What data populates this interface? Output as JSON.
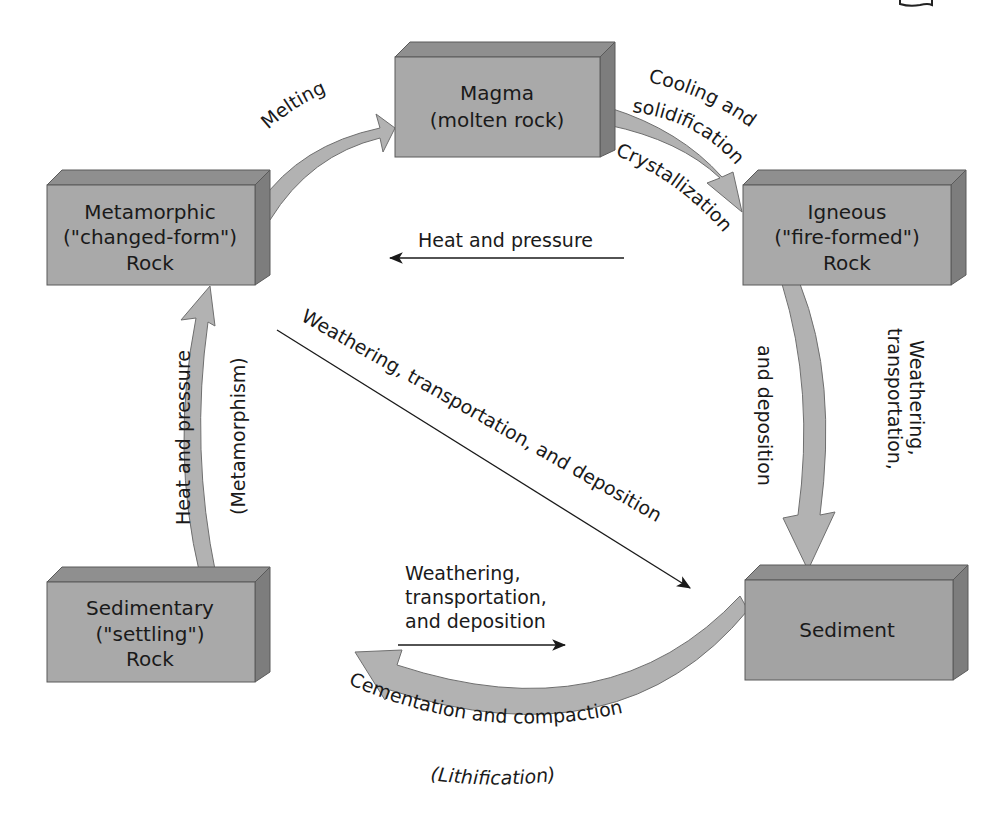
{
  "colors": {
    "box_front": "#a9a9a9",
    "box_top": "#8f8f8f",
    "box_side": "#7d7d7d",
    "arrow_fill": "#b2b2b2",
    "arrow_stroke": "#6f6f6f",
    "line": "#1a1a1a",
    "background": "#ffffff"
  },
  "boxes": {
    "magma": {
      "lines": [
        "Magma",
        "(molten rock)"
      ]
    },
    "igneous": {
      "lines": [
        "Igneous",
        "(\"fire-formed\")",
        "Rock"
      ]
    },
    "metamorphic": {
      "lines": [
        "Metamorphic",
        "(\"changed-form\")",
        "Rock"
      ]
    },
    "sedimentary": {
      "lines": [
        "Sedimentary",
        "(\"settling\")",
        "Rock"
      ]
    },
    "sediment": {
      "lines": [
        "Sediment"
      ]
    }
  },
  "processes": {
    "melting": "Melting",
    "cooling_line1": "Cooling and",
    "cooling_line2": "solidification",
    "crystallization": "Crystallization",
    "heat_pressure_top": "Heat and pressure",
    "weathering_right_line1": "Weathering,",
    "weathering_right_line2": "transportation,",
    "weathering_right_line3": "and deposition",
    "weathering_diagonal": "Weathering, transportation, and deposition",
    "weathering_bottom_line1": "Weathering,",
    "weathering_bottom_line2": "transportation,",
    "weathering_bottom_line3": "and deposition",
    "cementation": "Cementation and compaction",
    "lithification": "(Lithification)",
    "heat_pressure_left": "Heat and pressure",
    "metamorphism": "(Metamorphism)"
  },
  "corner_icon": "book-icon"
}
